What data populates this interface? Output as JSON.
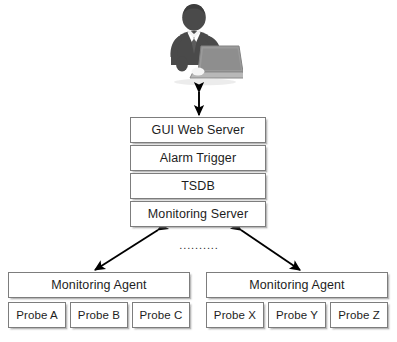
{
  "diagram": {
    "actor": {
      "icon": "businessman-with-laptop-icon",
      "label": ""
    },
    "server_stack": {
      "name": "central-server-stack",
      "boxes": [
        {
          "id": "gui-web-server",
          "label": "GUI Web Server"
        },
        {
          "id": "alarm-trigger",
          "label": "Alarm Trigger"
        },
        {
          "id": "tsdb",
          "label": "TSDB"
        },
        {
          "id": "monitoring-server",
          "label": "Monitoring Server"
        }
      ]
    },
    "agents": [
      {
        "id": "monitoring-agent-left",
        "label": "Monitoring Agent",
        "probes": [
          {
            "id": "probe-a",
            "label": "Probe A"
          },
          {
            "id": "probe-b",
            "label": "Probe B"
          },
          {
            "id": "probe-c",
            "label": "Probe C"
          }
        ]
      },
      {
        "id": "monitoring-agent-right",
        "label": "Monitoring Agent",
        "probes": [
          {
            "id": "probe-x",
            "label": "Probe X"
          },
          {
            "id": "probe-y",
            "label": "Probe Y"
          },
          {
            "id": "probe-z",
            "label": "Probe Z"
          }
        ]
      }
    ],
    "ellipsis": "..........",
    "connectors": [
      {
        "id": "actor-to-gui",
        "from": "actor",
        "to": "gui-web-server",
        "style": "double-headed-vertical"
      },
      {
        "id": "monitoring-server-to-agent-left",
        "from": "monitoring-server",
        "to": "monitoring-agent-left",
        "style": "double-headed-diagonal"
      },
      {
        "id": "monitoring-server-to-agent-right",
        "from": "monitoring-server",
        "to": "monitoring-agent-right",
        "style": "double-headed-diagonal"
      }
    ],
    "colors": {
      "background": "#ffffff",
      "box_fill": "#ffffff",
      "box_border": "#7d7d7d",
      "text": "#1d1d1d",
      "arrow": "#000000",
      "actor_dark": "#4a4a4a",
      "actor_laptop": "#9a9a9a"
    }
  }
}
